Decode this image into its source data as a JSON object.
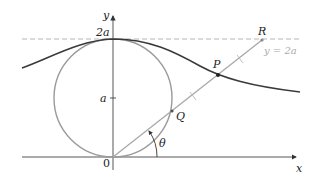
{
  "figure": {
    "colors": {
      "curve": "#3a3a3a",
      "circle": "#9a9a9a",
      "line": "#a8a8a8",
      "dashed": "#b0b0b0",
      "axes": "#444444",
      "asymptote_label": "#aaaaaa"
    },
    "labels": {
      "y_axis": "y",
      "x_axis": "x",
      "two_a": "2a",
      "a": "a",
      "origin": "0",
      "theta": "θ",
      "P": "P",
      "Q": "Q",
      "R": "R",
      "asymptote": "y = 2a"
    }
  }
}
